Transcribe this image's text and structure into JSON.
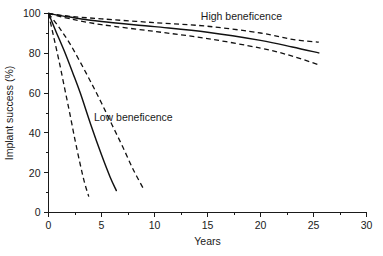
{
  "chart_data": {
    "type": "line",
    "title": "",
    "xlabel": "Years",
    "ylabel": "Implant success (%)",
    "xlim": [
      0,
      30
    ],
    "ylim": [
      0,
      100
    ],
    "xticks": [
      0,
      5,
      10,
      15,
      20,
      25,
      30
    ],
    "yticks": [
      0,
      20,
      40,
      60,
      80,
      100
    ],
    "xtick_labels": [
      "0",
      "5",
      "10",
      "15",
      "20",
      "25",
      "30"
    ],
    "ytick_labels": [
      "0",
      "20",
      "40",
      "60",
      "80",
      "100"
    ],
    "x_minor_ticks": [
      2.5,
      7.5,
      12.5,
      17.5,
      22.5,
      27.5
    ],
    "y_minor_ticks": [
      10,
      30,
      50,
      70,
      90
    ],
    "grid": false,
    "legend": "none",
    "annotations": [
      {
        "text": "High beneficence",
        "x": 18.2,
        "y": 96.5
      },
      {
        "text": "Low beneficence",
        "x": 8.0,
        "y": 46.0
      }
    ],
    "series": [
      {
        "name": "High beneficence - upper bound",
        "style": "dashed",
        "group": "high",
        "x": [
          0,
          2,
          5,
          10,
          15,
          20,
          23,
          25.5
        ],
        "values": [
          100,
          98.6,
          97.3,
          95.4,
          93.6,
          90.2,
          87.0,
          85.6
        ]
      },
      {
        "name": "High beneficence - estimate",
        "style": "solid",
        "group": "high",
        "x": [
          0,
          2,
          5,
          10,
          15,
          20,
          23,
          25.5
        ],
        "values": [
          100,
          98.2,
          96.0,
          93.4,
          90.6,
          86.5,
          83.2,
          80.2
        ]
      },
      {
        "name": "High beneficence - lower bound",
        "style": "dashed",
        "group": "high",
        "x": [
          0,
          2,
          5,
          10,
          15,
          20,
          23,
          25.5
        ],
        "values": [
          100,
          97.4,
          94.4,
          91.0,
          87.4,
          82.6,
          78.6,
          74.2
        ]
      },
      {
        "name": "Low beneficence - upper bound",
        "style": "dashed",
        "group": "low",
        "x": [
          0,
          1,
          2,
          3,
          4,
          5,
          6,
          7,
          8,
          9
        ],
        "values": [
          100,
          93.0,
          85.0,
          75.5,
          65.5,
          55.0,
          44.0,
          33.0,
          21.5,
          11.5
        ]
      },
      {
        "name": "Low beneficence - estimate",
        "style": "solid",
        "group": "low",
        "x": [
          0,
          0.7,
          1.5,
          2.3,
          3,
          4,
          5,
          5.8,
          6.4
        ],
        "values": [
          100,
          91.0,
          81.0,
          70.0,
          60.0,
          44.0,
          29.0,
          18.0,
          11.0
        ]
      },
      {
        "name": "Low beneficence - lower bound",
        "style": "dashed",
        "group": "low",
        "x": [
          0,
          0.5,
          1,
          1.5,
          2,
          2.5,
          3,
          3.4,
          3.8
        ],
        "values": [
          100,
          88.0,
          76.0,
          63.0,
          50.0,
          36.5,
          24.0,
          15.0,
          8.0
        ]
      }
    ]
  }
}
